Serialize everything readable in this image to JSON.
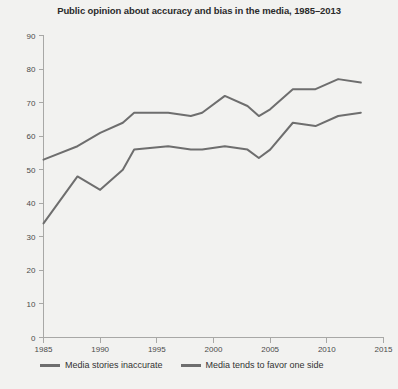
{
  "chart_data": {
    "type": "line",
    "title": "Public opinion about accuracy and bias in the media, 1985–2013",
    "xlabel": "",
    "ylabel": "",
    "xlim": [
      1985,
      2015
    ],
    "ylim": [
      0,
      90
    ],
    "xticks": [
      1985,
      1990,
      1995,
      2000,
      2005,
      2010,
      2015
    ],
    "xtick_labels": [
      "1985",
      "1990",
      "1995",
      "2000",
      "2005",
      "2010",
      "2015"
    ],
    "yticks": [
      0,
      10,
      20,
      30,
      40,
      50,
      60,
      70,
      80,
      90
    ],
    "ytick_labels": [
      "0",
      "10",
      "20",
      "30",
      "40",
      "50",
      "60",
      "70",
      "80",
      "90"
    ],
    "grid": false,
    "legend_position": "bottom-left",
    "line_color": "#6e6e6e",
    "background_color": "#f2f2f0",
    "series": [
      {
        "name": "Media tends to favor one side",
        "x": [
          1985,
          1988,
          1990,
          1992,
          1993,
          1996,
          1998,
          1999,
          2001,
          2003,
          2004,
          2005,
          2007,
          2009,
          2011,
          2013
        ],
        "values": [
          53,
          57,
          61,
          64,
          67,
          67,
          66,
          67,
          72,
          69,
          66,
          68,
          74,
          74,
          77,
          76
        ]
      },
      {
        "name": "Media stories inaccurate",
        "x": [
          1985,
          1988,
          1990,
          1992,
          1993,
          1996,
          1998,
          1999,
          2001,
          2003,
          2004,
          2005,
          2007,
          2009,
          2011,
          2013
        ],
        "values": [
          34,
          48,
          44,
          50,
          56,
          57,
          56,
          56,
          57,
          56,
          53.5,
          56,
          64,
          63,
          66,
          67
        ]
      }
    ]
  },
  "legend": {
    "items": [
      {
        "label": "Media stories inaccurate"
      },
      {
        "label": "Media tends to favor one side"
      }
    ]
  }
}
